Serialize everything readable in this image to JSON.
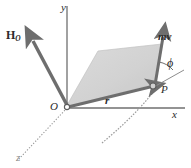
{
  "figure": {
    "type": "vector-mechanics-diagram",
    "background_color": "#ffffff"
  },
  "axes": {
    "x_label": "x",
    "y_label": "y",
    "z_label": "z",
    "axis_color": "#6f6f6f",
    "z_axis_style": "dotted"
  },
  "points": {
    "origin_label": "O",
    "particle_label": "P"
  },
  "vectors": {
    "angular_momentum_label": "H",
    "angular_momentum_subscript": "O",
    "position_label": "r",
    "momentum_label": "mv",
    "vector_color": "#707070",
    "arrow_color": "#7a7a7a"
  },
  "angles": {
    "phi_label": "ϕ"
  },
  "plane": {
    "name": "shaded-plane-of-r-and-mv",
    "fill_color": "#d0d0d0",
    "stroke_color": "#b4b4b4",
    "opacity": 0.85
  },
  "path": {
    "name": "particle-trajectory",
    "stroke_color": "#999999",
    "style": "curved"
  }
}
